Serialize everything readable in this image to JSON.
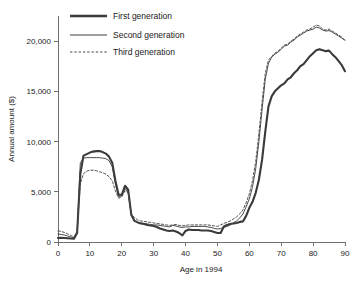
{
  "chart_data": {
    "type": "line",
    "title": "",
    "xlabel": "Age in 1994",
    "ylabel": "Annual amount ($)",
    "xlim": [
      0,
      90
    ],
    "ylim": [
      0,
      22500
    ],
    "grid": false,
    "legend_position": "top-left",
    "xticks": [
      0,
      10,
      20,
      30,
      40,
      50,
      60,
      70,
      80,
      90
    ],
    "xtick_labels": [
      "0",
      "10",
      "20",
      "30",
      "40",
      "50",
      "60",
      "70",
      "80",
      "90"
    ],
    "yticks": [
      0,
      5000,
      10000,
      15000,
      20000
    ],
    "ytick_labels": [
      "0",
      "5,000",
      "10,000",
      "15,000",
      "20,000"
    ],
    "x": [
      0,
      1,
      2,
      3,
      4,
      5,
      6,
      7,
      8,
      9,
      10,
      11,
      12,
      13,
      14,
      15,
      16,
      17,
      18,
      19,
      20,
      21,
      22,
      23,
      24,
      25,
      26,
      27,
      28,
      29,
      30,
      31,
      32,
      33,
      34,
      35,
      36,
      37,
      38,
      39,
      40,
      41,
      42,
      43,
      44,
      45,
      46,
      47,
      48,
      49,
      50,
      51,
      52,
      53,
      54,
      55,
      56,
      57,
      58,
      59,
      60,
      61,
      62,
      63,
      64,
      65,
      66,
      67,
      68,
      69,
      70,
      71,
      72,
      73,
      74,
      75,
      76,
      77,
      78,
      79,
      80,
      81,
      82,
      83,
      84,
      85,
      86,
      87,
      88,
      89,
      90
    ],
    "series": [
      {
        "name": "First generation",
        "style": "thick-solid",
        "values": [
          400,
          420,
          400,
          380,
          350,
          330,
          900,
          6800,
          8600,
          8750,
          8900,
          9000,
          9050,
          9050,
          8950,
          8800,
          8500,
          7900,
          6100,
          4700,
          4700,
          5600,
          5200,
          2700,
          2100,
          1950,
          1850,
          1800,
          1700,
          1650,
          1600,
          1500,
          1350,
          1250,
          1150,
          1100,
          1150,
          1050,
          900,
          650,
          1100,
          1250,
          1200,
          1200,
          1200,
          1150,
          1150,
          1150,
          1100,
          1000,
          900,
          900,
          1550,
          1700,
          1800,
          1850,
          1900,
          2000,
          2050,
          2600,
          3400,
          4000,
          4900,
          6200,
          8200,
          11000,
          13500,
          14500,
          15000,
          15300,
          15600,
          15800,
          16200,
          16400,
          16800,
          17100,
          17500,
          17700,
          18100,
          18500,
          18800,
          19100,
          19200,
          19100,
          19000,
          19050,
          18700,
          18400,
          18000,
          17600,
          17000
        ]
      },
      {
        "name": "Second generation",
        "style": "thin-solid",
        "values": [
          800,
          750,
          700,
          600,
          500,
          420,
          1000,
          7900,
          8350,
          8400,
          8400,
          8400,
          8400,
          8400,
          8350,
          8300,
          8100,
          7500,
          5800,
          4500,
          4600,
          5300,
          5000,
          2600,
          2100,
          1950,
          1900,
          1850,
          1800,
          1750,
          1700,
          1700,
          1650,
          1600,
          1550,
          1500,
          1650,
          1600,
          1500,
          1450,
          1500,
          1500,
          1550,
          1550,
          1550,
          1550,
          1550,
          1500,
          1450,
          1350,
          1300,
          1350,
          1450,
          1550,
          1700,
          1900,
          2100,
          2400,
          2800,
          3500,
          4300,
          5500,
          7300,
          10000,
          13200,
          16200,
          17800,
          18400,
          18700,
          18900,
          19200,
          19500,
          19600,
          19900,
          20100,
          20400,
          20600,
          20800,
          21000,
          21100,
          21200,
          21400,
          21300,
          21100,
          21000,
          21050,
          20900,
          20700,
          20500,
          20300,
          20100
        ]
      },
      {
        "name": "Third generation",
        "style": "dotted",
        "values": [
          1100,
          1050,
          950,
          820,
          650,
          500,
          1100,
          5800,
          6800,
          7050,
          7150,
          7150,
          7100,
          7000,
          6900,
          6750,
          6500,
          6100,
          5100,
          4350,
          4500,
          5100,
          4900,
          2800,
          2400,
          2200,
          2100,
          2050,
          2000,
          1950,
          1900,
          1850,
          1800,
          1750,
          1700,
          1650,
          1700,
          1750,
          1650,
          1600,
          1650,
          1700,
          1700,
          1700,
          1700,
          1700,
          1700,
          1700,
          1650,
          1600,
          1550,
          1700,
          1850,
          1950,
          2100,
          2300,
          2500,
          2800,
          3200,
          3900,
          4800,
          6100,
          8000,
          10800,
          14000,
          16800,
          18100,
          18500,
          18800,
          19000,
          19300,
          19600,
          19700,
          20000,
          20200,
          20500,
          20700,
          20900,
          21100,
          21200,
          21400,
          21600,
          21500,
          21200,
          21100,
          21200,
          21000,
          20800,
          20600,
          20400,
          20000
        ]
      }
    ]
  },
  "legend": {
    "items": [
      {
        "label": "First generation"
      },
      {
        "label": "Second generation"
      },
      {
        "label": "Third generation"
      }
    ]
  }
}
